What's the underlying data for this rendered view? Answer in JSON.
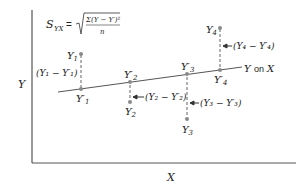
{
  "formula": {
    "lhs": "S",
    "lhs_sub": "YX",
    "equals": "=",
    "numerator": "Σ(Y − Y′)²",
    "denominator": "n"
  },
  "axes": {
    "y_label": "Y",
    "x_label": "X"
  },
  "regression_line": {
    "label_y": "Y",
    "label_on": "on",
    "label_x": "X"
  },
  "points": [
    {
      "actual": "Y",
      "actual_sub": "1",
      "predicted": "Y′",
      "predicted_sub": "1",
      "residual": "(Y₁ − Y′₁)"
    },
    {
      "actual": "Y",
      "actual_sub": "2",
      "predicted": "Y′",
      "predicted_sub": "2",
      "residual": "(Y₂ − Y′₂)"
    },
    {
      "actual": "Y",
      "actual_sub": "3",
      "predicted": "Y′",
      "predicted_sub": "3",
      "residual": "(Y₃ − Y′₃)"
    },
    {
      "actual": "Y",
      "actual_sub": "4",
      "predicted": "Y′",
      "predicted_sub": "4",
      "residual": "(Y₄ − Y′₄)"
    }
  ],
  "colors": {
    "line": "#555555",
    "dot": "#8a8a8a",
    "text": "#222222"
  }
}
